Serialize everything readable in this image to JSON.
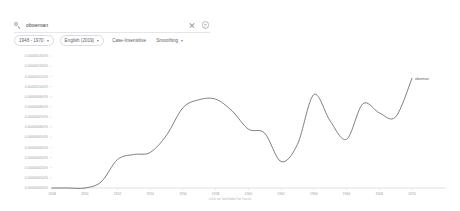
{
  "search": {
    "query": "oboeman",
    "placeholder": "Search in Google Books",
    "search_icon": "search-icon",
    "clear_icon": "close-icon",
    "info_icon": "info-icon",
    "info_glyph": "?"
  },
  "filters": [
    {
      "label": "1948 - 1970",
      "has_caret": true,
      "outlined": true
    },
    {
      "label": "English (2019)",
      "has_caret": true,
      "outlined": true
    },
    {
      "label": "Case-Insensitive",
      "has_caret": false,
      "outlined": false
    },
    {
      "label": "Smoothing",
      "has_caret": true,
      "outlined": false
    }
  ],
  "caption": "click on line/label for focus",
  "colors": {
    "line": "#606060",
    "axis": "#d0d3d6",
    "tick_text": "#9aa0a6",
    "chip_border": "#dadce0",
    "background": "#ffffff"
  },
  "chart_data": {
    "type": "line",
    "title": "",
    "xlabel": "",
    "ylabel": "",
    "grid": false,
    "legend_position": "right-inline",
    "xlim": [
      1948,
      1970
    ],
    "ylim": [
      0,
      1.3e-07
    ],
    "xticks": [
      1948,
      1950,
      1952,
      1954,
      1956,
      1958,
      1960,
      1962,
      1964,
      1966,
      1968,
      1970
    ],
    "xtick_labels": [
      "1948",
      "1950",
      "1952",
      "1954",
      "1956",
      "1958",
      "1960",
      "1962",
      "1964",
      "1966",
      "1968",
      "1970"
    ],
    "yticks": [
      0.0,
      1e-08,
      2e-08,
      3e-08,
      4e-08,
      5e-08,
      6e-08,
      7e-08,
      8e-08,
      9e-08,
      1e-07,
      1.1e-07,
      1.2e-07,
      1.3e-07
    ],
    "ytick_labels": [
      "0.0000000000%",
      "0.0000000100%",
      "0.0000000200%",
      "0.0000000300%",
      "0.0000000400%",
      "0.0000000500%",
      "0.0000000600%",
      "0.0000000700%",
      "0.0000000800%",
      "0.0000000900%",
      "0.0000001000%",
      "0.0000001100%",
      "0.0000001200%",
      "0.0000001300%"
    ],
    "series": [
      {
        "name": "oboeman",
        "color": "#606060",
        "x": [
          1948,
          1949,
          1950,
          1951,
          1952,
          1953,
          1954,
          1955,
          1956,
          1957,
          1958,
          1959,
          1960,
          1961,
          1962,
          1963,
          1964,
          1965,
          1966,
          1967,
          1968,
          1969,
          1970
        ],
        "values": [
          0.0,
          0.0,
          0.0,
          6e-09,
          2.8e-08,
          3.3e-08,
          3.5e-08,
          5.2e-08,
          7.9e-08,
          8.7e-08,
          8.75e-08,
          7.6e-08,
          5.8e-08,
          5.4e-08,
          2.6e-08,
          4.3e-08,
          9.2e-08,
          6.6e-08,
          4.8e-08,
          8.3e-08,
          7.4e-08,
          7e-08,
          1.08e-07
        ]
      }
    ]
  }
}
